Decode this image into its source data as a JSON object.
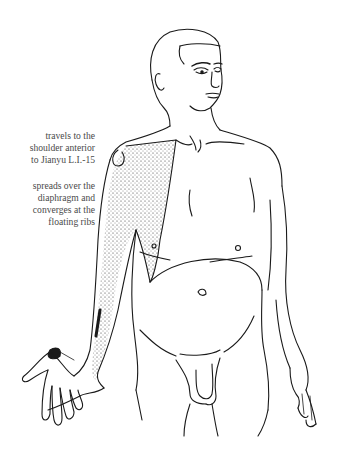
{
  "diagram": {
    "annotations": [
      {
        "id": "shoulder",
        "lines": [
          "travels to the",
          "shoulder anterior",
          "to Jianyu L.I.-15"
        ]
      },
      {
        "id": "diaphragm",
        "lines": [
          "spreads over the",
          "diaphragm and",
          "converges at the",
          "floating ribs"
        ]
      }
    ],
    "colors": {
      "line": "#1a1a1a",
      "stipple": "#2a2a2a",
      "text": "#4a4a4a",
      "background": "#ffffff"
    }
  }
}
